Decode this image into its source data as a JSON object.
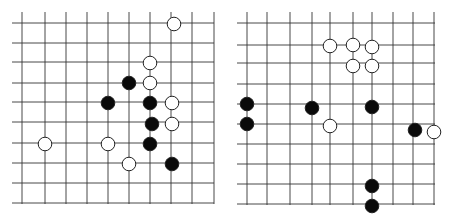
{
  "colors": {
    "line": "#333333",
    "black_stone": "#0a0a0a",
    "white_stone": "#ffffff",
    "stone_edge": "#222222",
    "background": "#ffffff"
  },
  "boards": [
    {
      "name": "left-board",
      "left": 12,
      "top": 12,
      "xs": [
        10,
        33,
        54,
        75,
        96,
        117,
        138,
        159,
        180,
        202
      ],
      "ys": [
        11,
        31,
        50,
        71,
        90,
        110,
        131,
        151,
        171,
        191
      ],
      "line_x_start": 0,
      "line_x_end": 202,
      "line_y_start": 0,
      "line_y_end": 192,
      "stones": [
        {
          "color": "white",
          "x": 162,
          "y": 12
        },
        {
          "color": "white",
          "x": 138,
          "y": 51
        },
        {
          "color": "black",
          "x": 117,
          "y": 71
        },
        {
          "color": "white",
          "x": 138,
          "y": 71
        },
        {
          "color": "black",
          "x": 96,
          "y": 91
        },
        {
          "color": "black",
          "x": 138,
          "y": 91
        },
        {
          "color": "white",
          "x": 160,
          "y": 91
        },
        {
          "color": "black",
          "x": 140,
          "y": 112
        },
        {
          "color": "white",
          "x": 160,
          "y": 112
        },
        {
          "color": "white",
          "x": 33,
          "y": 132
        },
        {
          "color": "white",
          "x": 96,
          "y": 132
        },
        {
          "color": "black",
          "x": 138,
          "y": 132
        },
        {
          "color": "white",
          "x": 117,
          "y": 152
        },
        {
          "color": "black",
          "x": 160,
          "y": 152
        }
      ]
    },
    {
      "name": "right-board",
      "left": 237,
      "top": 12,
      "xs": [
        10,
        30,
        53,
        75,
        93,
        116,
        135,
        156,
        176,
        197
      ],
      "ys": [
        11,
        33,
        51,
        72,
        92,
        112,
        132,
        152,
        172,
        192
      ],
      "line_x_start": 0,
      "line_x_end": 198,
      "line_y_start": 0,
      "line_y_end": 193,
      "stones": [
        {
          "color": "white",
          "x": 93,
          "y": 34
        },
        {
          "color": "white",
          "x": 116,
          "y": 33
        },
        {
          "color": "white",
          "x": 135,
          "y": 35
        },
        {
          "color": "white",
          "x": 116,
          "y": 54
        },
        {
          "color": "white",
          "x": 135,
          "y": 54
        },
        {
          "color": "black",
          "x": 10,
          "y": 92
        },
        {
          "color": "black",
          "x": 75,
          "y": 96
        },
        {
          "color": "black",
          "x": 135,
          "y": 95
        },
        {
          "color": "black",
          "x": 10,
          "y": 112
        },
        {
          "color": "white",
          "x": 93,
          "y": 114
        },
        {
          "color": "black",
          "x": 178,
          "y": 118
        },
        {
          "color": "white",
          "x": 197,
          "y": 120
        },
        {
          "color": "black",
          "x": 135,
          "y": 174
        },
        {
          "color": "black",
          "x": 135,
          "y": 194
        }
      ]
    }
  ]
}
